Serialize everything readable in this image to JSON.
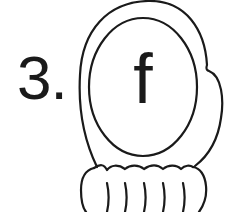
{
  "worksheet": {
    "item_number": "3.",
    "letter": "f",
    "illustration": "mitten-outline",
    "colors": {
      "stroke": "#1a1a1a",
      "background": "#ffffff"
    }
  }
}
